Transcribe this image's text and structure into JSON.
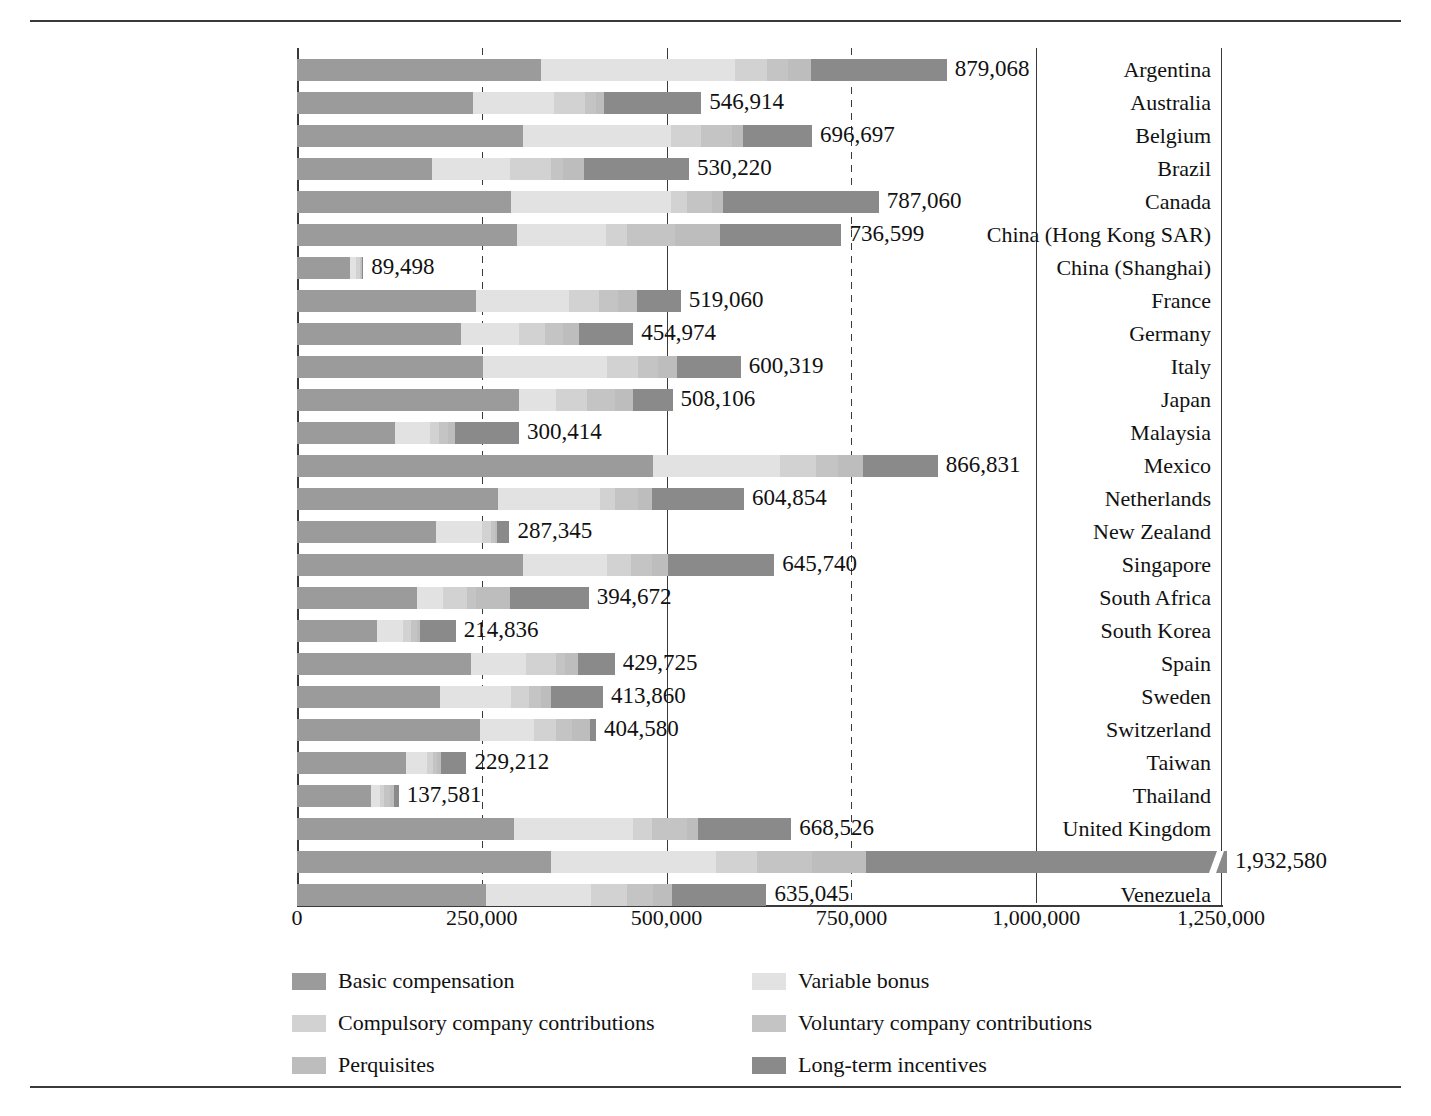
{
  "chart_data": {
    "type": "bar",
    "subtype": "horizontal-stacked",
    "title": "",
    "xlabel": "",
    "ylabel": "",
    "xlim": [
      0,
      1250000
    ],
    "xticks": [
      0,
      250000,
      500000,
      750000,
      1000000,
      1250000
    ],
    "xtick_labels": [
      "0",
      "250,000",
      "500,000",
      "750,000",
      "1,000,000",
      "1,250,000"
    ],
    "grid": true,
    "grid_axis": "x",
    "legend_position": "bottom",
    "series": [
      {
        "name": "Basic compensation",
        "color": "#9b9b9b"
      },
      {
        "name": "Variable bonus",
        "color": "#e2e2e2"
      },
      {
        "name": "Compulsory company contributions",
        "color": "#d2d2d2"
      },
      {
        "name": "Voluntary company contributions",
        "color": "#c4c4c4"
      },
      {
        "name": "Perquisites",
        "color": "#bdbdbd"
      },
      {
        "name": "Long-term incentives",
        "color": "#8a8a8a"
      }
    ],
    "categories": [
      "Argentina",
      "Australia",
      "Belgium",
      "Brazil",
      "Canada",
      "China (Hong Kong SAR)",
      "China (Shanghai)",
      "France",
      "Germany",
      "Italy",
      "Japan",
      "Malaysia",
      "Mexico",
      "Netherlands",
      "New Zealand",
      "Singapore",
      "South Africa",
      "South Korea",
      "Spain",
      "Sweden",
      "Switzerland",
      "Taiwan",
      "Thailand",
      "United Kingdom",
      "United States",
      "Venezuela"
    ],
    "totals": [
      879068,
      546914,
      696697,
      530220,
      787060,
      736599,
      89498,
      519060,
      454974,
      600319,
      508106,
      300414,
      866831,
      604854,
      287345,
      645740,
      394672,
      214836,
      429725,
      413860,
      404580,
      229212,
      137581,
      668526,
      1932580,
      635045
    ],
    "total_labels": [
      "879,068",
      "546,914",
      "696,697",
      "530,220",
      "787,060",
      "736,599",
      "89,498",
      "519,060",
      "454,974",
      "600,319",
      "508,106",
      "300,414",
      "866,831",
      "604,854",
      "287,345",
      "645,740",
      "394,672",
      "214,836",
      "429,725",
      "413,860",
      "404,580",
      "229,212",
      "137,581",
      "668,526",
      "1,932,580",
      "635,045"
    ],
    "stacks": [
      {
        "country": "Argentina",
        "values": [
          330000,
          262000,
          44000,
          28000,
          32000,
          183068
        ]
      },
      {
        "country": "Australia",
        "values": [
          238000,
          110000,
          42000,
          14000,
          12000,
          130914
        ]
      },
      {
        "country": "Belgium",
        "values": [
          306000,
          200000,
          40000,
          42000,
          16000,
          92697
        ]
      },
      {
        "country": "Brazil",
        "values": [
          182000,
          106000,
          56000,
          16000,
          28000,
          142220
        ]
      },
      {
        "country": "Canada",
        "values": [
          290000,
          216000,
          22000,
          34000,
          14000,
          211060
        ]
      },
      {
        "country": "China (Hong Kong SAR)",
        "values": [
          298000,
          120000,
          28000,
          66000,
          60000,
          164599
        ]
      },
      {
        "country": "China (Shanghai)",
        "values": [
          72000,
          8000,
          5000,
          2000,
          1000,
          1498
        ]
      },
      {
        "country": "France",
        "values": [
          242000,
          126000,
          40000,
          26000,
          26000,
          59060
        ]
      },
      {
        "country": "Germany",
        "values": [
          222000,
          78000,
          36000,
          24000,
          22000,
          72974
        ]
      },
      {
        "country": "Italy",
        "values": [
          252000,
          168000,
          42000,
          26000,
          26000,
          86319
        ]
      },
      {
        "country": "Japan",
        "values": [
          300000,
          50000,
          42000,
          38000,
          24000,
          54106
        ]
      },
      {
        "country": "Malaysia",
        "values": [
          132000,
          48000,
          12000,
          12000,
          10000,
          86414
        ]
      },
      {
        "country": "Mexico",
        "values": [
          482000,
          172000,
          48000,
          30000,
          34000,
          100831
        ]
      },
      {
        "country": "Netherlands",
        "values": [
          272000,
          138000,
          20000,
          32000,
          18000,
          124854
        ]
      },
      {
        "country": "New Zealand",
        "values": [
          188000,
          62000,
          12000,
          6000,
          2000,
          17345
        ]
      },
      {
        "country": "Singapore",
        "values": [
          306000,
          114000,
          32000,
          28000,
          22000,
          143740
        ]
      },
      {
        "country": "South Africa",
        "values": [
          162000,
          36000,
          32000,
          12000,
          46000,
          106672
        ]
      },
      {
        "country": "South Korea",
        "values": [
          108000,
          36000,
          10000,
          8000,
          4000,
          48836
        ]
      },
      {
        "country": "Spain",
        "values": [
          236000,
          74000,
          40000,
          12000,
          18000,
          49725
        ]
      },
      {
        "country": "Sweden",
        "values": [
          194000,
          96000,
          24000,
          16000,
          14000,
          69860
        ]
      },
      {
        "country": "Switzerland",
        "values": [
          248000,
          72000,
          30000,
          22000,
          24000,
          8580
        ]
      },
      {
        "country": "Taiwan",
        "values": [
          148000,
          28000,
          8000,
          6000,
          5000,
          34212
        ]
      },
      {
        "country": "Thailand",
        "values": [
          100000,
          12000,
          6000,
          8000,
          5000,
          6581
        ]
      },
      {
        "country": "United Kingdom",
        "values": [
          294000,
          160000,
          26000,
          48000,
          14000,
          126526
        ]
      },
      {
        "country": "United States",
        "values": [
          536000,
          348000,
          86000,
          116000,
          114000,
          732580
        ]
      },
      {
        "country": "Venezuela",
        "values": [
          256000,
          142000,
          48000,
          36000,
          26000,
          127045
        ]
      }
    ],
    "notes": {
      "united_states_axis_break": true,
      "units": "currency units"
    }
  },
  "legend": {
    "items": [
      {
        "label": "Basic compensation",
        "color": "#9b9b9b"
      },
      {
        "label": "Variable bonus",
        "color": "#e2e2e2"
      },
      {
        "label": "Compulsory company contributions",
        "color": "#d2d2d2"
      },
      {
        "label": "Voluntary company contributions",
        "color": "#c4c4c4"
      },
      {
        "label": "Perquisites",
        "color": "#bdbdbd"
      },
      {
        "label": "Long-term incentives",
        "color": "#8a8a8a"
      }
    ]
  }
}
